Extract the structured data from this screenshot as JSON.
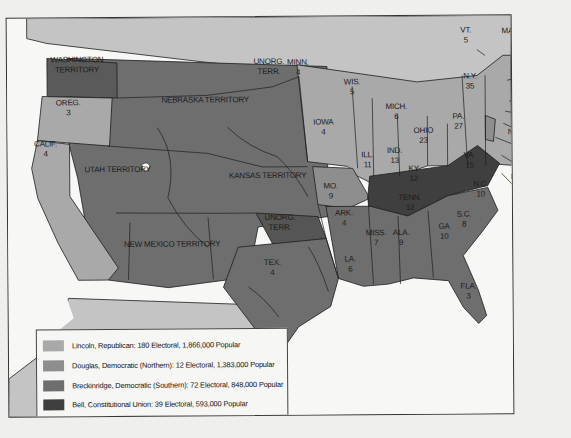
{
  "colors": {
    "lincoln": "#a9a9a9",
    "douglas": "#8e8e8e",
    "breckinridge": "#6e6e6e",
    "bell": "#3f3f3f",
    "foreign": "#c4c4c4",
    "water": "#f7f7f5",
    "border": "#1e1e1e"
  },
  "legend": [
    {
      "candidate": "Lincoln",
      "text": "Lincoln, Republican: 180 Electoral, 1,866,000 Popular",
      "color_key": "lincoln"
    },
    {
      "candidate": "Douglas",
      "text": "Douglas, Democratic (Northern): 12 Electoral, 1,383,000 Popular",
      "color_key": "douglas"
    },
    {
      "candidate": "Breckinridge",
      "text": "Breckinridge, Democratic (Southern): 72 Electoral, 848,000 Popular",
      "color_key": "breckinridge"
    },
    {
      "candidate": "Bell",
      "text": "Bell, Constitutional Union: 39 Electoral, 593,000 Popular",
      "color_key": "bell"
    }
  ],
  "labels": [
    {
      "name": "WASHINGTON TERRITORY",
      "line1": "WASHINGTON",
      "line2": "TERRITORY",
      "x": 77,
      "y": 53
    },
    {
      "name": "OREG.",
      "line1": "OREG.",
      "line2": "3",
      "x": 68,
      "y": 96
    },
    {
      "name": "CALIF.",
      "line1": "CALIF.",
      "line2": "4",
      "x": 45,
      "y": 137
    },
    {
      "name": "UTAH TERRITORY",
      "line1": "UTAH TERRITORY",
      "line2": "",
      "x": 117,
      "y": 163
    },
    {
      "name": "NEBRASKA TERRITORY",
      "line1": "NEBRASKA TERRITORY",
      "line2": "",
      "x": 205,
      "y": 94
    },
    {
      "name": "UNORG. TERR. (north)",
      "line1": "UNORG.",
      "line2": "TERR.",
      "x": 269,
      "y": 56
    },
    {
      "name": "KANSAS TERRITORY",
      "line1": "KANSAS TERRITORY",
      "line2": "",
      "x": 267,
      "y": 170
    },
    {
      "name": "NEW MEXICO TERRITORY",
      "line1": "NEW MEXICO TERRITORY",
      "line2": "",
      "x": 171,
      "y": 238
    },
    {
      "name": "UNORG. TERR. (south)",
      "line1": "UNORG.",
      "line2": "TERR.",
      "x": 279,
      "y": 212
    },
    {
      "name": "TEX.",
      "line1": "TEX.",
      "line2": "4",
      "x": 271,
      "y": 257
    },
    {
      "name": "MINN.",
      "line1": "MINN.",
      "line2": "4",
      "x": 298,
      "y": 57
    },
    {
      "name": "WIS.",
      "line1": "WIS.",
      "line2": "5",
      "x": 352,
      "y": 77
    },
    {
      "name": "IOWA",
      "line1": "IOWA",
      "line2": "4",
      "x": 323,
      "y": 117
    },
    {
      "name": "ILL.",
      "line1": "ILL.",
      "line2": "11",
      "x": 367,
      "y": 150
    },
    {
      "name": "MICH.",
      "line1": "MICH.",
      "line2": "6",
      "x": 396,
      "y": 102
    },
    {
      "name": "IND.",
      "line1": "IND.",
      "line2": "13",
      "x": 394,
      "y": 146
    },
    {
      "name": "OHIO",
      "line1": "OHIO",
      "line2": "23",
      "x": 423,
      "y": 126
    },
    {
      "name": "MO.",
      "line1": "MO.",
      "line2": "9",
      "x": 330,
      "y": 181
    },
    {
      "name": "ARK.",
      "line1": "ARK.",
      "line2": "4",
      "x": 343,
      "y": 208
    },
    {
      "name": "KY",
      "line1": "KY",
      "line2": "12",
      "x": 413,
      "y": 164
    },
    {
      "name": "TENN.",
      "line1": "TENN.",
      "line2": "12",
      "x": 409,
      "y": 193
    },
    {
      "name": "VA.",
      "line1": "VA.",
      "line2": "15",
      "x": 469,
      "y": 151
    },
    {
      "name": "N.C.",
      "line1": "N.C.",
      "line2": "10",
      "x": 480,
      "y": 180
    },
    {
      "name": "S.C.",
      "line1": "S.C.",
      "line2": "8",
      "x": 463,
      "y": 210
    },
    {
      "name": "GA",
      "line1": "GA",
      "line2": "10",
      "x": 443,
      "y": 222
    },
    {
      "name": "ALA.",
      "line1": "ALA.",
      "line2": "9",
      "x": 400,
      "y": 228
    },
    {
      "name": "MISS.",
      "line1": "MISS.",
      "line2": "7",
      "x": 375,
      "y": 228
    },
    {
      "name": "LA.",
      "line1": "LA.",
      "line2": "6",
      "x": 349,
      "y": 254
    },
    {
      "name": "FLA.",
      "line1": "FLA.",
      "line2": "3",
      "x": 467,
      "y": 282
    },
    {
      "name": "PA.",
      "line1": "PA.",
      "line2": "27",
      "x": 458,
      "y": 112
    },
    {
      "name": "N.Y.",
      "line1": "N.Y.",
      "line2": "35",
      "x": 470,
      "y": 72
    },
    {
      "name": "VT.",
      "line1": "VT.",
      "line2": "5",
      "x": 466,
      "y": 26
    },
    {
      "name": "MAINE",
      "line1": "MAINE",
      "line2": "8",
      "x": 514,
      "y": 27
    }
  ],
  "callouts": [
    {
      "name": "N.H.",
      "line1": "N.H.",
      "line2": "5",
      "x": 537,
      "y": 56
    },
    {
      "name": "MASS.",
      "line1": "MASS.",
      "line2": "3",
      "x": 540,
      "y": 77
    },
    {
      "name": "R.I.",
      "line1": "R.I.",
      "line2": "4",
      "x": 533,
      "y": 98
    },
    {
      "name": "CONN.",
      "line1": "CONN.",
      "line2": "6",
      "x": 538,
      "y": 124
    },
    {
      "name": "N.J.",
      "line1": "N.J.",
      "line2": "4",
      "x": 514,
      "y": 128
    },
    {
      "name": "DEL.",
      "line1": "DEL.",
      "line2": "3",
      "x": 523,
      "y": 151
    },
    {
      "name": "MD.",
      "line1": "MD.",
      "line2": "8",
      "x": 517,
      "y": 173
    }
  ]
}
